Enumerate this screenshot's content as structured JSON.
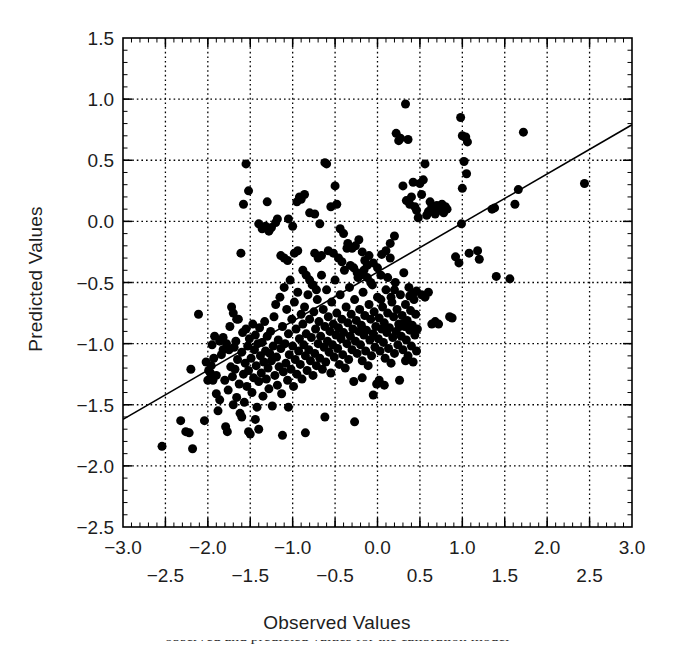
{
  "figure": {
    "type": "scatter-plot-with-regression-line",
    "background": "#ffffff",
    "foreground": "#000000"
  },
  "labels": {
    "xlabel": "Observed Values",
    "ylabel": "Predicted Values",
    "caption_cropped": "observed and predicted values for the calibration model"
  },
  "chart_data": {
    "type": "scatter",
    "title": "",
    "xlabel": "Observed Values",
    "ylabel": "Predicted Values",
    "xlim": [
      -3.0,
      3.0
    ],
    "ylim": [
      -2.5,
      1.5
    ],
    "grid": true,
    "grid_step_x": 0.5,
    "grid_step_y": 0.5,
    "legend": "none",
    "xticks_major": [
      "-3.0",
      "-2.0",
      "-1.0",
      "0.0",
      "1.0",
      "2.0",
      "3.0"
    ],
    "xticks_major_values": [
      -3.0,
      -2.0,
      -1.0,
      0.0,
      1.0,
      2.0,
      3.0
    ],
    "xticks_minor": [
      "-2.5",
      "-1.5",
      "-0.5",
      "0.5",
      "1.5",
      "2.5"
    ],
    "xticks_minor_values": [
      -2.5,
      -1.5,
      -0.5,
      0.5,
      1.5,
      2.5
    ],
    "yticks": [
      "1.5",
      "1.0",
      "0.5",
      "0.0",
      "-0.5",
      "-1.0",
      "-1.5",
      "-2.0",
      "-2.5"
    ],
    "yticks_values": [
      1.5,
      1.0,
      0.5,
      0.0,
      -0.5,
      -1.0,
      -1.5,
      -2.0,
      -2.5
    ],
    "marker": "filled-circle",
    "marker_color": "#000000",
    "marker_size_px": 9,
    "n_points": 452,
    "fit_line": {
      "label": "regression line",
      "color": "#000000",
      "width_px": 1.6,
      "x_start": -3.0,
      "y_start": -1.62,
      "x_end": 3.0,
      "y_end": 0.79,
      "slope": 0.402,
      "intercept": -0.415
    },
    "points": [
      [
        -2.54,
        -1.84
      ],
      [
        -2.32,
        -1.63
      ],
      [
        -2.26,
        -1.72
      ],
      [
        -2.22,
        -1.73
      ],
      [
        -2.18,
        -1.86
      ],
      [
        -2.2,
        -1.21
      ],
      [
        -2.11,
        -0.76
      ],
      [
        -2.04,
        -1.63
      ],
      [
        -2.0,
        -1.3
      ],
      [
        -1.97,
        -1.24
      ],
      [
        -1.95,
        -1.01
      ],
      [
        -1.93,
        -1.12
      ],
      [
        -1.92,
        -0.94
      ],
      [
        -1.9,
        -1.41
      ],
      [
        -1.88,
        -1.55
      ],
      [
        -1.86,
        -1.46
      ],
      [
        -1.84,
        -1.09
      ],
      [
        -1.82,
        -0.95
      ],
      [
        -1.8,
        -1.3
      ],
      [
        -1.79,
        -1.68
      ],
      [
        -1.77,
        -1.72
      ],
      [
        -1.76,
        -1.38
      ],
      [
        -1.75,
        -1.05
      ],
      [
        -1.74,
        -0.86
      ],
      [
        -1.73,
        -1.19
      ],
      [
        -1.72,
        -0.7
      ],
      [
        -1.71,
        -1.27
      ],
      [
        -1.7,
        -1.5
      ],
      [
        -1.69,
        -1.03
      ],
      [
        -1.68,
        -1.21
      ],
      [
        -1.67,
        -0.98
      ],
      [
        -1.66,
        -1.44
      ],
      [
        -1.65,
        -1.13
      ],
      [
        -1.64,
        -0.8
      ],
      [
        -1.63,
        -1.33
      ],
      [
        -1.62,
        -1.57
      ],
      [
        -1.61,
        -0.26
      ],
      [
        -1.6,
        -1.07
      ],
      [
        -1.59,
        -0.91
      ],
      [
        -1.58,
        -1.25
      ],
      [
        -1.57,
        -1.48
      ],
      [
        -1.56,
        -1.16
      ],
      [
        -1.55,
        -0.88
      ],
      [
        -1.54,
        -1.35
      ],
      [
        -1.53,
        -1.02
      ],
      [
        -1.52,
        -1.22
      ],
      [
        -1.51,
        -0.96
      ],
      [
        -1.5,
        -1.74
      ],
      [
        -1.49,
        -1.12
      ],
      [
        -1.48,
        -1.4
      ],
      [
        -1.47,
        -0.84
      ],
      [
        -1.46,
        -1.28
      ],
      [
        -1.45,
        -1.05
      ],
      [
        -1.44,
        -0.93
      ],
      [
        -1.43,
        -1.18
      ],
      [
        -1.42,
        -1.52
      ],
      [
        -1.41,
        -1.0
      ],
      [
        -1.4,
        -1.31
      ],
      [
        -1.39,
        -0.87
      ],
      [
        -1.38,
        -1.1
      ],
      [
        -1.37,
        -1.24
      ],
      [
        -1.36,
        -0.99
      ],
      [
        -1.35,
        -1.43
      ],
      [
        -1.34,
        -1.15
      ],
      [
        -1.33,
        -0.82
      ],
      [
        -1.32,
        -1.06
      ],
      [
        -1.31,
        -1.29
      ],
      [
        -1.3,
        -0.94
      ],
      [
        -1.29,
        -1.2
      ],
      [
        -1.28,
        -1.37
      ],
      [
        -1.27,
        -1.08
      ],
      [
        -1.26,
        -0.9
      ],
      [
        -1.25,
        -1.14
      ],
      [
        -1.24,
        -1.51
      ],
      [
        -1.23,
        -1.02
      ],
      [
        -1.22,
        -0.78
      ],
      [
        -1.21,
        -1.26
      ],
      [
        -1.2,
        -0.68
      ],
      [
        -1.19,
        -1.11
      ],
      [
        -1.18,
        -1.34
      ],
      [
        -1.17,
        -0.97
      ],
      [
        -1.16,
        -1.19
      ],
      [
        -1.15,
        -0.62
      ],
      [
        -1.14,
        -1.04
      ],
      [
        -1.13,
        -1.41
      ],
      [
        -1.12,
        -0.86
      ],
      [
        -1.11,
        -1.23
      ],
      [
        -1.1,
        -0.54
      ],
      [
        -1.09,
        -1.0
      ],
      [
        -1.08,
        -1.16
      ],
      [
        -1.07,
        -0.72
      ],
      [
        -1.06,
        -1.3
      ],
      [
        -1.05,
        -0.92
      ],
      [
        -1.04,
        -1.09
      ],
      [
        -1.03,
        -0.48
      ],
      [
        -1.02,
        -1.21
      ],
      [
        -1.01,
        -0.8
      ],
      [
        -1.0,
        -1.02
      ],
      [
        -0.99,
        -1.35
      ],
      [
        -0.98,
        -0.66
      ],
      [
        -0.97,
        -1.13
      ],
      [
        -0.96,
        -0.88
      ],
      [
        -0.95,
        -1.25
      ],
      [
        -0.94,
        -0.58
      ],
      [
        -0.93,
        -1.06
      ],
      [
        -0.92,
        -0.96
      ],
      [
        -0.91,
        -1.17
      ],
      [
        -0.9,
        -0.76
      ],
      [
        -0.89,
        -1.29
      ],
      [
        -0.88,
        -0.84
      ],
      [
        -0.87,
        -1.01
      ],
      [
        -0.86,
        -0.7
      ],
      [
        -0.85,
        -1.1
      ],
      [
        -0.84,
        -0.92
      ],
      [
        -0.83,
        -1.22
      ],
      [
        -0.82,
        -0.6
      ],
      [
        -0.81,
        -1.05
      ],
      [
        -0.8,
        -0.8
      ],
      [
        -0.79,
        -1.14
      ],
      [
        -0.78,
        -0.95
      ],
      [
        -0.77,
        -0.52
      ],
      [
        -0.76,
        -1.26
      ],
      [
        -0.75,
        -0.74
      ],
      [
        -0.74,
        -1.08
      ],
      [
        -0.73,
        -0.88
      ],
      [
        -0.72,
        -1.18
      ],
      [
        -0.71,
        -0.64
      ],
      [
        -0.7,
        -1.0
      ],
      [
        -0.69,
        -0.82
      ],
      [
        -0.68,
        -1.12
      ],
      [
        -0.67,
        -0.94
      ],
      [
        -0.66,
        -0.44
      ],
      [
        -0.65,
        -1.21
      ],
      [
        -0.64,
        -0.72
      ],
      [
        -0.63,
        -1.03
      ],
      [
        -0.62,
        -0.86
      ],
      [
        -0.61,
        -1.15
      ],
      [
        -0.6,
        -0.56
      ],
      [
        -0.59,
        -0.98
      ],
      [
        -0.58,
        -0.78
      ],
      [
        -0.57,
        -1.07
      ],
      [
        -0.56,
        -0.9
      ],
      [
        -0.55,
        -1.24
      ],
      [
        -0.54,
        -0.66
      ],
      [
        -0.53,
        -1.01
      ],
      [
        -0.52,
        -0.84
      ],
      [
        -0.51,
        -1.11
      ],
      [
        -0.5,
        -0.48
      ],
      [
        -0.49,
        -0.93
      ],
      [
        -0.48,
        -0.75
      ],
      [
        -0.47,
        -1.04
      ],
      [
        -0.46,
        -0.87
      ],
      [
        -0.45,
        -1.17
      ],
      [
        -0.44,
        -0.6
      ],
      [
        -0.43,
        -0.96
      ],
      [
        -0.42,
        -0.8
      ],
      [
        -0.41,
        -1.09
      ],
      [
        -0.4,
        -0.91
      ],
      [
        -0.39,
        -0.4
      ],
      [
        -0.38,
        -1.2
      ],
      [
        -0.37,
        -0.7
      ],
      [
        -0.36,
        -1.0
      ],
      [
        -0.35,
        -0.83
      ],
      [
        -0.34,
        -1.13
      ],
      [
        -0.33,
        -0.54
      ],
      [
        -0.32,
        -0.94
      ],
      [
        -0.31,
        -0.76
      ],
      [
        -0.3,
        -1.05
      ],
      [
        -0.29,
        -0.88
      ],
      [
        -0.28,
        -1.31
      ],
      [
        -0.27,
        -0.64
      ],
      [
        -0.26,
        -0.98
      ],
      [
        -0.25,
        -0.81
      ],
      [
        -0.24,
        -1.08
      ],
      [
        -0.23,
        -0.46
      ],
      [
        -0.22,
        -0.9
      ],
      [
        -0.21,
        -0.72
      ],
      [
        -0.2,
        -1.01
      ],
      [
        -0.19,
        -0.85
      ],
      [
        -0.18,
        -1.14
      ],
      [
        -0.17,
        -0.58
      ],
      [
        -0.16,
        -0.93
      ],
      [
        -0.15,
        -0.77
      ],
      [
        -0.14,
        -1.06
      ],
      [
        -0.13,
        -0.89
      ],
      [
        -0.12,
        -0.36
      ],
      [
        -0.11,
        -1.18
      ],
      [
        -0.1,
        -0.68
      ],
      [
        -0.09,
        -0.97
      ],
      [
        -0.08,
        -0.8
      ],
      [
        -0.07,
        -1.1
      ],
      [
        -0.06,
        -0.52
      ],
      [
        -0.05,
        -0.92
      ],
      [
        -0.04,
        -0.74
      ],
      [
        -0.03,
        -1.03
      ],
      [
        -0.02,
        -0.86
      ],
      [
        -0.01,
        -1.33
      ],
      [
        0.0,
        -0.62
      ],
      [
        0.01,
        -0.96
      ],
      [
        0.02,
        -0.79
      ],
      [
        0.03,
        -1.06
      ],
      [
        0.04,
        -0.44
      ],
      [
        0.05,
        -0.88
      ],
      [
        0.06,
        -0.7
      ],
      [
        0.07,
        -0.99
      ],
      [
        0.08,
        -0.83
      ],
      [
        0.09,
        -1.12
      ],
      [
        0.1,
        -0.56
      ],
      [
        0.11,
        -0.91
      ],
      [
        0.12,
        -0.75
      ],
      [
        0.13,
        -1.04
      ],
      [
        0.14,
        -0.87
      ],
      [
        0.15,
        -0.3
      ],
      [
        0.16,
        -1.16
      ],
      [
        0.17,
        -0.66
      ],
      [
        0.18,
        -0.95
      ],
      [
        0.19,
        -0.78
      ],
      [
        0.2,
        -1.08
      ],
      [
        0.21,
        -0.5
      ],
      [
        0.22,
        -0.9
      ],
      [
        0.23,
        -0.72
      ],
      [
        0.24,
        -1.01
      ],
      [
        0.25,
        -0.84
      ],
      [
        0.26,
        -1.3
      ],
      [
        0.27,
        -0.6
      ],
      [
        0.28,
        -0.94
      ],
      [
        0.29,
        -0.77
      ],
      [
        0.3,
        -1.05
      ],
      [
        0.31,
        -0.42
      ],
      [
        0.32,
        -0.86
      ],
      [
        0.33,
        -0.68
      ],
      [
        0.34,
        -0.97
      ],
      [
        0.35,
        -0.81
      ],
      [
        0.36,
        -1.1
      ],
      [
        0.37,
        -0.54
      ],
      [
        0.38,
        -0.89
      ],
      [
        0.39,
        -0.73
      ],
      [
        0.4,
        -1.02
      ],
      [
        0.41,
        -0.85
      ],
      [
        0.42,
        -1.15
      ],
      [
        0.43,
        -0.64
      ],
      [
        0.44,
        -0.93
      ],
      [
        0.45,
        -0.76
      ],
      [
        0.46,
        -1.06
      ],
      [
        0.47,
        -0.88
      ],
      [
        -1.55,
        0.47
      ],
      [
        -1.52,
        0.25
      ],
      [
        -1.58,
        0.14
      ],
      [
        -1.3,
        0.16
      ],
      [
        -1.18,
        0.02
      ],
      [
        -1.2,
        -0.01
      ],
      [
        -1.05,
        0.02
      ],
      [
        -1.0,
        -0.04
      ],
      [
        -0.95,
        0.16
      ],
      [
        -0.92,
        0.2
      ],
      [
        -0.9,
        0.18
      ],
      [
        -0.86,
        0.22
      ],
      [
        -0.8,
        0.07
      ],
      [
        -0.74,
        0.06
      ],
      [
        -0.68,
        -0.02
      ],
      [
        -0.62,
        0.48
      ],
      [
        -0.6,
        0.47
      ],
      [
        -0.55,
        0.12
      ],
      [
        -0.5,
        0.29
      ],
      [
        -0.48,
        0.14
      ],
      [
        -0.44,
        -0.06
      ],
      [
        -0.4,
        -0.1
      ],
      [
        -0.35,
        -0.18
      ],
      [
        -0.3,
        -0.22
      ],
      [
        -0.26,
        -0.2
      ],
      [
        -0.22,
        -0.15
      ],
      [
        -0.18,
        -0.25
      ],
      [
        -0.15,
        -0.32
      ],
      [
        -0.1,
        -0.28
      ],
      [
        -0.05,
        -0.34
      ],
      [
        0.0,
        -0.38
      ],
      [
        0.05,
        -0.27
      ],
      [
        0.1,
        -0.24
      ],
      [
        0.15,
        -0.18
      ],
      [
        0.2,
        -0.12
      ],
      [
        0.22,
        0.72
      ],
      [
        0.25,
        0.66
      ],
      [
        0.27,
        0.68
      ],
      [
        0.33,
        0.96
      ],
      [
        0.36,
        0.67
      ],
      [
        0.3,
        0.29
      ],
      [
        0.34,
        0.17
      ],
      [
        0.38,
        0.14
      ],
      [
        0.4,
        0.2
      ],
      [
        0.42,
        0.32
      ],
      [
        0.44,
        0.12
      ],
      [
        0.46,
        0.09
      ],
      [
        0.48,
        0.03
      ],
      [
        0.5,
        0.31
      ],
      [
        0.52,
        0.22
      ],
      [
        0.54,
        0.34
      ],
      [
        0.56,
        0.47
      ],
      [
        0.58,
        0.05
      ],
      [
        0.6,
        0.08
      ],
      [
        0.62,
        0.16
      ],
      [
        0.64,
        0.12
      ],
      [
        0.66,
        0.1
      ],
      [
        0.68,
        0.06
      ],
      [
        0.7,
        0.13
      ],
      [
        0.72,
        0.11
      ],
      [
        0.74,
        0.09
      ],
      [
        0.76,
        0.14
      ],
      [
        0.78,
        0.07
      ],
      [
        0.8,
        0.12
      ],
      [
        0.82,
        0.1
      ],
      [
        0.98,
        0.85
      ],
      [
        1.0,
        0.7
      ],
      [
        1.04,
        0.69
      ],
      [
        1.06,
        0.65
      ],
      [
        1.02,
        0.49
      ],
      [
        1.05,
        0.39
      ],
      [
        1.0,
        0.27
      ],
      [
        0.99,
        -0.02
      ],
      [
        1.08,
        -0.26
      ],
      [
        1.18,
        -0.24
      ],
      [
        1.2,
        -0.31
      ],
      [
        0.92,
        -0.29
      ],
      [
        0.96,
        -0.34
      ],
      [
        0.85,
        -0.78
      ],
      [
        0.88,
        -0.79
      ],
      [
        1.35,
        0.1
      ],
      [
        1.38,
        0.11
      ],
      [
        1.4,
        -0.45
      ],
      [
        1.56,
        -0.47
      ],
      [
        1.62,
        0.14
      ],
      [
        1.66,
        0.26
      ],
      [
        1.72,
        0.73
      ],
      [
        2.44,
        0.31
      ],
      [
        0.33,
        -1.14
      ],
      [
        -0.27,
        -1.64
      ],
      [
        -0.62,
        -1.6
      ],
      [
        -0.85,
        -1.73
      ],
      [
        -1.05,
        -1.52
      ],
      [
        -1.12,
        -1.75
      ],
      [
        -1.4,
        -1.7
      ],
      [
        -1.44,
        -1.62
      ],
      [
        -1.52,
        -1.72
      ],
      [
        -1.6,
        -1.6
      ],
      [
        0.52,
        -0.6
      ],
      [
        0.56,
        -0.62
      ],
      [
        0.6,
        -0.58
      ],
      [
        0.64,
        -0.84
      ],
      [
        0.68,
        -0.82
      ],
      [
        0.72,
        -0.84
      ],
      [
        0.46,
        -0.57
      ],
      [
        0.42,
        -0.59
      ],
      [
        0.38,
        -0.61
      ],
      [
        0.2,
        -0.56
      ],
      [
        0.12,
        -0.46
      ],
      [
        0.08,
        -1.34
      ],
      [
        0.02,
        -1.3
      ],
      [
        -0.05,
        -1.42
      ],
      [
        -0.18,
        -1.28
      ],
      [
        0.3,
        -0.84
      ],
      [
        0.34,
        -0.82
      ],
      [
        0.26,
        -0.86
      ],
      [
        0.16,
        -0.62
      ],
      [
        0.04,
        -0.64
      ],
      [
        -0.7,
        -0.3
      ],
      [
        -0.74,
        -0.26
      ],
      [
        -0.66,
        -0.28
      ],
      [
        -0.58,
        -0.24
      ],
      [
        -0.52,
        -0.26
      ],
      [
        -0.46,
        -0.3
      ],
      [
        -0.42,
        -0.33
      ],
      [
        -0.36,
        -0.22
      ],
      [
        -0.32,
        -0.36
      ],
      [
        -0.28,
        -0.38
      ],
      [
        -0.24,
        -0.42
      ],
      [
        -0.2,
        -0.44
      ],
      [
        -0.16,
        -0.4
      ],
      [
        -0.12,
        -0.46
      ],
      [
        -0.08,
        -0.5
      ],
      [
        -1.25,
        -0.05
      ],
      [
        -1.28,
        -0.08
      ],
      [
        -1.32,
        -0.04
      ],
      [
        -1.36,
        -0.06
      ],
      [
        -1.4,
        -0.02
      ],
      [
        -1.1,
        -0.3
      ],
      [
        -1.14,
        -0.28
      ],
      [
        -1.06,
        -0.32
      ],
      [
        -0.98,
        -0.26
      ],
      [
        -0.94,
        -0.24
      ],
      [
        -1.7,
        -0.75
      ],
      [
        -1.66,
        -0.8
      ],
      [
        -1.78,
        -1.0
      ],
      [
        -1.82,
        -1.05
      ],
      [
        -1.86,
        -0.98
      ],
      [
        -1.96,
        -1.18
      ],
      [
        -1.99,
        -1.22
      ],
      [
        -2.02,
        -1.15
      ],
      [
        -1.9,
        -1.26
      ],
      [
        -1.94,
        -1.3
      ],
      [
        -0.88,
        -0.4
      ],
      [
        -0.84,
        -0.44
      ],
      [
        -0.8,
        -0.48
      ],
      [
        -0.76,
        -0.52
      ],
      [
        -0.72,
        -0.56
      ]
    ]
  }
}
